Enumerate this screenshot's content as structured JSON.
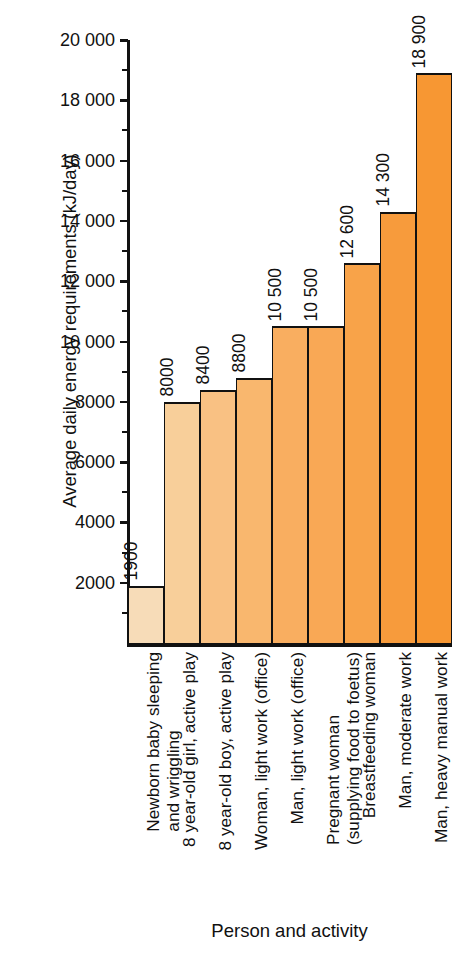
{
  "chart_data": {
    "type": "bar",
    "title": "",
    "ylabel": "Average daily energy requirements (kJ/day)",
    "xlabel": "Person and activity",
    "ylim": [
      0,
      20000
    ],
    "grid": false,
    "legend": "none",
    "y_major_step": 2000,
    "y_minor_step": 1000,
    "y_tick_labels": [
      "2000",
      "4000",
      "6000",
      "8000",
      "10 000",
      "12 000",
      "14 000",
      "16 000",
      "18 000",
      "20 000"
    ],
    "y_tick_values": [
      2000,
      4000,
      6000,
      8000,
      10000,
      12000,
      14000,
      16000,
      18000,
      20000
    ],
    "categories": [
      "Newborn baby sleeping and wriggling",
      "8 year-old girl, active play",
      "8 year-old boy, active play",
      "Woman, light work (office)",
      "Man, light work (office)",
      "Pregnant woman (supplying food to foetus)",
      "Breastfeeding woman",
      "Man, moderate work",
      "Man, heavy manual work"
    ],
    "category_lines": [
      [
        "Newborn baby sleeping",
        "and wriggling"
      ],
      [
        "8 year-old girl, active play"
      ],
      [
        "8 year-old boy, active play"
      ],
      [
        "Woman, light work (office)"
      ],
      [
        "Man, light work (office)"
      ],
      [
        "Pregnant woman",
        "(supplying food to foetus)"
      ],
      [
        "Breastfeeding woman"
      ],
      [
        "Man, moderate work"
      ],
      [
        "Man, heavy manual work"
      ]
    ],
    "values": [
      1900,
      8000,
      8400,
      8800,
      10500,
      10500,
      12600,
      14300,
      18900
    ],
    "value_labels": [
      "1900",
      "8000",
      "8400",
      "8800",
      "10 500",
      "10 500",
      "12 600",
      "14 300",
      "18 900"
    ],
    "bar_colors": [
      "#f7dcb8",
      "#f8cf9a",
      "#f9c183",
      "#f9b76e",
      "#f9ae60",
      "#f9a855",
      "#f8a349",
      "#f79b3c",
      "#f79733"
    ],
    "bar_outline_color": "#111111",
    "axis_color": "#111111",
    "background_color": "#ffffff"
  }
}
